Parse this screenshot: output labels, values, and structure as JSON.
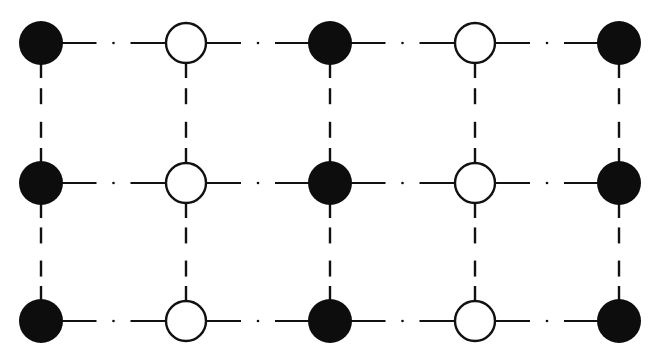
{
  "diagram": {
    "type": "lattice",
    "columns_x": [
      41,
      186,
      330,
      475,
      619
    ],
    "rows_y": [
      43,
      183,
      321
    ],
    "filled_radius": 22,
    "open_radius": 20,
    "column_types": [
      "filled",
      "open",
      "filled",
      "open",
      "filled"
    ],
    "colors": {
      "stroke": "#111111",
      "filled": "#0d0d0d",
      "open": "#ffffff",
      "background": "#ffffff"
    }
  }
}
